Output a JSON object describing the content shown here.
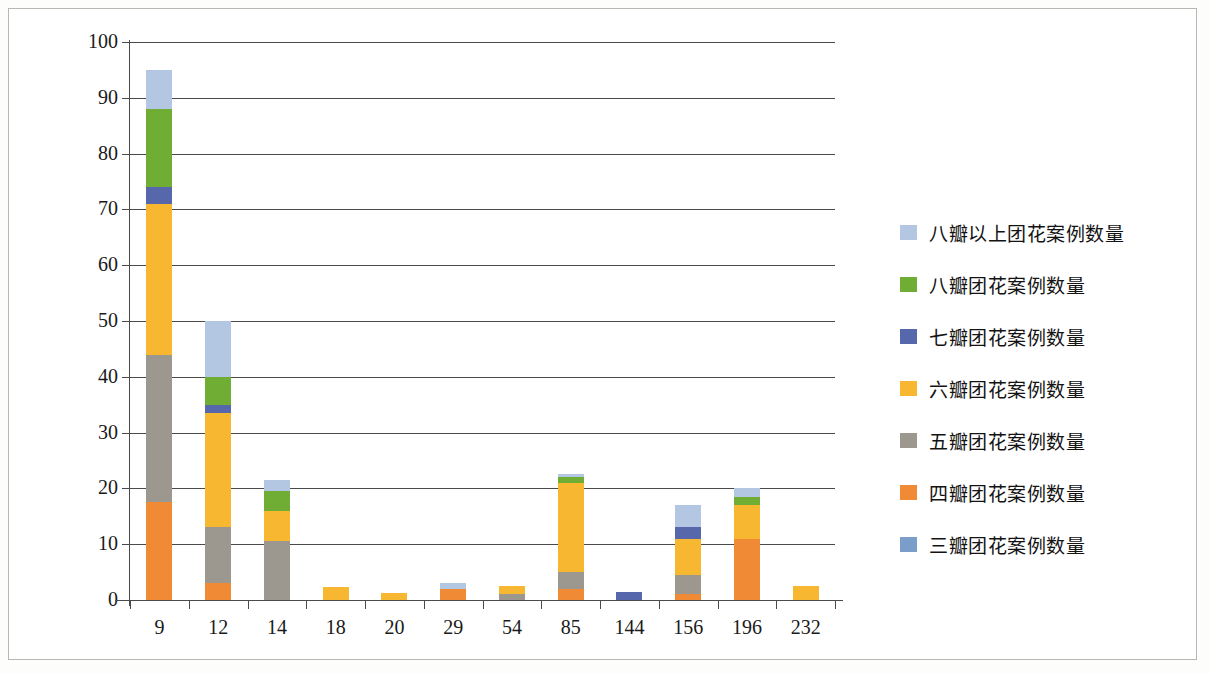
{
  "chart_data": {
    "type": "bar",
    "subtype": "stacked",
    "title": "",
    "xlabel": "",
    "ylabel": "",
    "ylim": [
      0,
      100
    ],
    "ytick_step": 10,
    "ytick_labels": [
      "100",
      "90",
      "80",
      "70",
      "60",
      "50",
      "40",
      "30",
      "20",
      "10",
      "0"
    ],
    "grid": "horizontal",
    "legend_position": "right",
    "categories": [
      "9",
      "12",
      "14",
      "18",
      "20",
      "29",
      "54",
      "85",
      "144",
      "156",
      "196",
      "232"
    ],
    "series": [
      {
        "name": "三瓣团花案例数量",
        "color": "#7a9ec9",
        "values": [
          0,
          0,
          0,
          0,
          0,
          0,
          0,
          0,
          0,
          0,
          0,
          0
        ]
      },
      {
        "name": "四瓣团花案例数量",
        "color": "#f08a34",
        "values": [
          17.5,
          3,
          0,
          0,
          0,
          2,
          0,
          2,
          0,
          1,
          11,
          0
        ]
      },
      {
        "name": "五瓣团花案例数量",
        "color": "#9c9890",
        "values": [
          26.5,
          10,
          10.5,
          0,
          0,
          0,
          1,
          3,
          0,
          3.5,
          0,
          0
        ]
      },
      {
        "name": "六瓣团花案例数量",
        "color": "#f7b731",
        "values": [
          27,
          20.5,
          5.5,
          2.3,
          1.3,
          0,
          1.5,
          16,
          0,
          6.5,
          6,
          2.5
        ]
      },
      {
        "name": "七瓣团花案例数量",
        "color": "#5767ab",
        "values": [
          3,
          1.5,
          0,
          0,
          0,
          0,
          0,
          0,
          1.5,
          2,
          0,
          0
        ]
      },
      {
        "name": "八瓣团花案例数量",
        "color": "#70ad34",
        "values": [
          14,
          5,
          3.5,
          0,
          0,
          0,
          0,
          1,
          0,
          0,
          1.5,
          0
        ]
      },
      {
        "name": "八瓣以上团花案例数量",
        "color": "#b3c6e2",
        "values": [
          7,
          10,
          2,
          0,
          0,
          1,
          0,
          0.5,
          0,
          4,
          1.5,
          0
        ]
      }
    ],
    "legend_entries": [
      {
        "label": "八瓣以上团花案例数量",
        "color": "#b3c6e2"
      },
      {
        "label": "八瓣团花案例数量",
        "color": "#70ad34"
      },
      {
        "label": "七瓣团花案例数量",
        "color": "#5767ab"
      },
      {
        "label": "六瓣团花案例数量",
        "color": "#f7b731"
      },
      {
        "label": "五瓣团花案例数量",
        "color": "#9c9890"
      },
      {
        "label": "四瓣团花案例数量",
        "color": "#f08a34"
      },
      {
        "label": "三瓣团花案例数量",
        "color": "#7a9ec9"
      }
    ],
    "stack_order_bottom_to_top": [
      "四瓣团花案例数量",
      "五瓣团花案例数量",
      "六瓣团花案例数量",
      "七瓣团花案例数量",
      "八瓣团花案例数量",
      "八瓣以上团花案例数量"
    ],
    "totals": [
      95,
      50,
      21.5,
      2.3,
      1.3,
      3,
      2.5,
      22.5,
      1.5,
      17,
      20,
      2.5
    ]
  }
}
